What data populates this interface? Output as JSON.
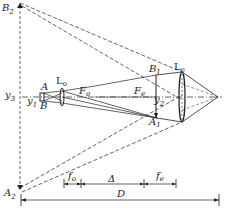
{
  "diagram": {
    "type": "microscope-ray-diagram",
    "colors": {
      "line": "#222222",
      "background": "#ffffff"
    },
    "labels": {
      "B2": {
        "main": "B",
        "sub": "2"
      },
      "A2": {
        "main": "A",
        "sub": "2"
      },
      "y3": {
        "main": "y",
        "sub": "3"
      },
      "A": {
        "main": "A"
      },
      "B": {
        "main": "B"
      },
      "y1": {
        "main": "y",
        "sub": "1"
      },
      "Lo": {
        "main": "L",
        "sub": "o"
      },
      "Fo": {
        "main": "F",
        "sub": "o"
      },
      "Fe": {
        "main": "F",
        "sub": "e"
      },
      "B1": {
        "main": "B",
        "sub": "1"
      },
      "A1": {
        "main": "A",
        "sub": "1"
      },
      "y2": {
        "main": "y",
        "sub": "2"
      },
      "Le": {
        "main": "L",
        "sub": "e"
      }
    },
    "dimensions": {
      "fo": {
        "main": "f",
        "sub": "o"
      },
      "delta": {
        "main": "Δ"
      },
      "fe": {
        "main": "f",
        "sub": "e"
      },
      "D": {
        "main": "D"
      }
    }
  }
}
